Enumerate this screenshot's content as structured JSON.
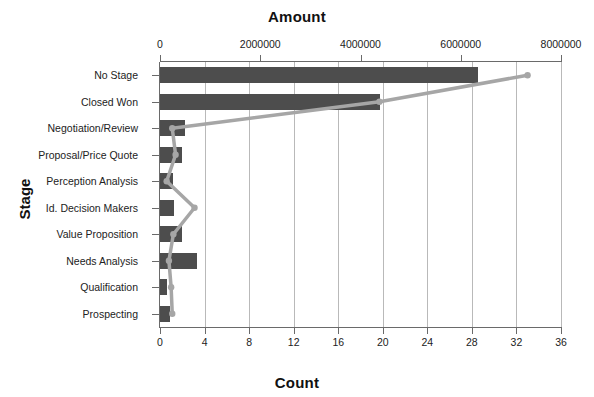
{
  "chart_data": {
    "type": "bar",
    "title": "",
    "top_axis_title": "Amount",
    "bottom_axis_title": "Count",
    "ylabel": "Stage",
    "categories": [
      "No Stage",
      "Closed Won",
      "Negotiation/Review",
      "Proposal/Price Quote",
      "Perception Analysis",
      "Id. Decision Makers",
      "Value Proposition",
      "Needs Analysis",
      "Qualification",
      "Prospecting"
    ],
    "series": [
      {
        "name": "Amount",
        "type": "bar",
        "axis": "top",
        "color": "#4d4d4d",
        "values": [
          6350000,
          4390000,
          500000,
          440000,
          250000,
          270000,
          440000,
          745000,
          130000,
          190000
        ]
      },
      {
        "name": "Count",
        "type": "line",
        "axis": "bottom",
        "color": "#a6a6a6",
        "values": [
          33,
          19.7,
          1.1,
          1.4,
          0.6,
          3.1,
          1.2,
          0.8,
          1.0,
          1.1
        ]
      }
    ],
    "amount_axis": {
      "label": "Amount",
      "min": 0,
      "max": 8000000,
      "ticks": [
        0,
        2000000,
        4000000,
        6000000,
        8000000
      ],
      "tick_labels": [
        "0",
        "2000000",
        "4000000",
        "6000000",
        "8000000"
      ],
      "position": "top"
    },
    "count_axis": {
      "label": "Count",
      "min": 0,
      "max": 36,
      "ticks": [
        0,
        4,
        8,
        12,
        16,
        20,
        24,
        28,
        32,
        36
      ],
      "tick_labels": [
        "0",
        "4",
        "8",
        "12",
        "16",
        "20",
        "24",
        "28",
        "32",
        "36"
      ],
      "position": "bottom"
    },
    "grid": true,
    "legend": "none"
  }
}
